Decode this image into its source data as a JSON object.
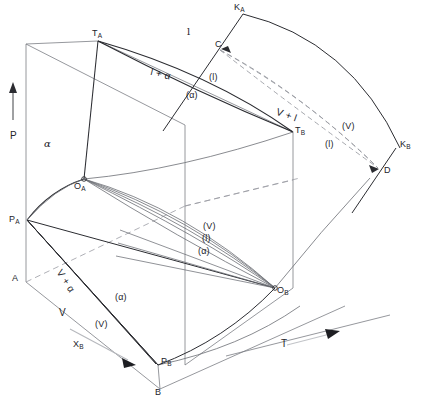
{
  "figure": {
    "type": "phase-diagram",
    "axes": [
      {
        "name": "pressure-axis",
        "label": "P",
        "direction": "up"
      },
      {
        "name": "temperature-axis",
        "label": "T",
        "direction": "right"
      },
      {
        "name": "composition-axis",
        "label": "X",
        "sub": "B",
        "direction": "lower-right"
      }
    ],
    "vertex_labels": [
      {
        "id": "T_A",
        "text": "T",
        "sub": "A",
        "x": 92,
        "y": 29
      },
      {
        "id": "T_B",
        "text": "T",
        "sub": "B",
        "x": 295,
        "y": 126
      },
      {
        "id": "O_A",
        "text": "O",
        "sub": "A",
        "x": 74,
        "y": 182
      },
      {
        "id": "O_B",
        "text": "O",
        "sub": "B",
        "x": 277,
        "y": 286
      },
      {
        "id": "P_A",
        "text": "P",
        "sub": "A",
        "x": 9,
        "y": 215
      },
      {
        "id": "P_B",
        "text": "P",
        "sub": "B",
        "x": 161,
        "y": 357
      },
      {
        "id": "K_A",
        "text": "K",
        "sub": "A",
        "x": 234,
        "y": 3
      },
      {
        "id": "K_B",
        "text": "K",
        "sub": "B",
        "x": 400,
        "y": 140
      },
      {
        "id": "A",
        "text": "A",
        "sub": "",
        "x": 12,
        "y": 274
      },
      {
        "id": "B",
        "text": "B",
        "sub": "",
        "x": 155,
        "y": 388
      },
      {
        "id": "C",
        "text": "C",
        "sub": "",
        "x": 215,
        "y": 40
      },
      {
        "id": "D",
        "text": "D",
        "sub": "",
        "x": 384,
        "y": 166
      }
    ],
    "field_labels": [
      {
        "id": "alpha-field",
        "text": "α",
        "x": 44,
        "y": 139
      },
      {
        "id": "liquid-field",
        "text": "l",
        "x": 187,
        "y": 27
      },
      {
        "id": "liquid-plus-alpha",
        "text": "l  +  α",
        "x": 152,
        "y": 67
      },
      {
        "id": "vapour-plus-liquid",
        "text": "V  +  l",
        "x": 278,
        "y": 107
      },
      {
        "id": "vapour-plus-alpha",
        "text": "V  +  α",
        "x": 63,
        "y": 268
      },
      {
        "id": "vapour-field",
        "text": "V",
        "x": 59,
        "y": 308
      }
    ],
    "curve_labels": [
      {
        "id": "alpha-paren-upper",
        "text": "(α)",
        "x": 186,
        "y": 91
      },
      {
        "id": "liquid-paren-upper",
        "text": "(l)",
        "x": 209,
        "y": 73
      },
      {
        "id": "liquid-paren-right",
        "text": "(l)",
        "x": 325,
        "y": 140
      },
      {
        "id": "vapour-paren-right",
        "text": "(V)",
        "x": 342,
        "y": 122
      },
      {
        "id": "vapour-paren-mid",
        "text": "(V)",
        "x": 203,
        "y": 222
      },
      {
        "id": "liquid-paren-mid",
        "text": "(l)",
        "x": 202,
        "y": 234
      },
      {
        "id": "alpha-paren-mid",
        "text": "(α)",
        "x": 198,
        "y": 247
      },
      {
        "id": "alpha-paren-lower",
        "text": "(α)",
        "x": 115,
        "y": 293
      },
      {
        "id": "vapour-paren-lower",
        "text": "(V)",
        "x": 95,
        "y": 320
      }
    ],
    "axis_labels": [
      {
        "id": "pressure-label",
        "text": "P",
        "x": 10,
        "y": 131
      },
      {
        "id": "temperature-label",
        "text": "T",
        "x": 281,
        "y": 339
      },
      {
        "id": "composition-label",
        "text": "X",
        "sub": "B",
        "x": 73,
        "y": 340
      }
    ],
    "colors": {
      "solid_line": "#2b2c31",
      "thin_line": "#6b6d74",
      "dashed_line": "#9a9ca3",
      "background": "#ffffff",
      "text": "#23242a"
    }
  }
}
